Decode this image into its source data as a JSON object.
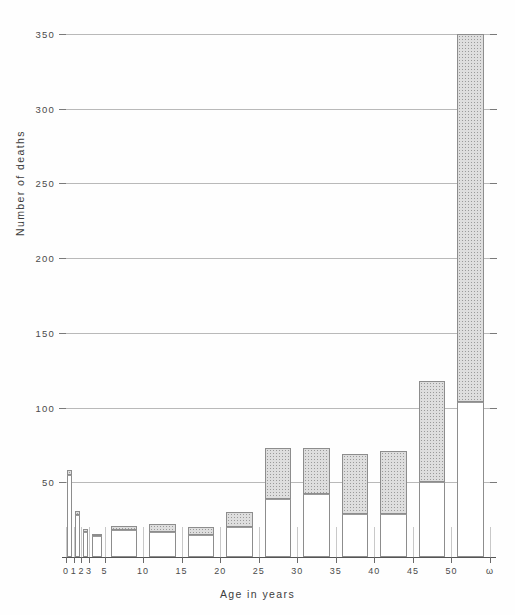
{
  "chart_data": {
    "type": "bar",
    "title": "",
    "xlabel": "Age in years",
    "ylabel": "Number of deaths",
    "ylim": [
      0,
      350
    ],
    "ytick_values": [
      50,
      100,
      150,
      200,
      250,
      300,
      350
    ],
    "ytick_labels": [
      "50",
      "100",
      "150",
      "200",
      "250",
      "300",
      "350"
    ],
    "xtick_labels": [
      "0",
      "1",
      "2",
      "3",
      "5",
      "10",
      "15",
      "20",
      "25",
      "30",
      "35",
      "40",
      "45",
      "50",
      "ω"
    ],
    "grid": "horizontal",
    "legend": "none",
    "stacked": true,
    "categories": [
      "0-1",
      "1-2",
      "2-3",
      "3-5",
      "5-10",
      "10-15",
      "15-20",
      "20-25",
      "25-30",
      "30-35",
      "35-40",
      "40-45",
      "45-50",
      "50-ω"
    ],
    "series": [
      {
        "name": "lower segment (unshaded)",
        "fill": "white",
        "values": [
          55,
          28,
          17,
          14,
          18,
          17,
          15,
          20,
          39,
          42,
          29,
          29,
          50,
          104
        ]
      },
      {
        "name": "upper segment (shaded)",
        "fill": "stippled",
        "values": [
          3,
          3,
          2,
          1,
          3,
          5,
          5,
          10,
          34,
          31,
          40,
          42,
          68,
          246
        ]
      }
    ],
    "totals": [
      58,
      31,
      19,
      15,
      21,
      22,
      20,
      30,
      73,
      73,
      69,
      71,
      118,
      350
    ],
    "bar_bounds": [
      {
        "label": "0-1",
        "x0": 0,
        "x1": 1
      },
      {
        "label": "1-2",
        "x0": 1,
        "x1": 2
      },
      {
        "label": "2-3",
        "x0": 2,
        "x1": 3
      },
      {
        "label": "3-5",
        "x0": 3,
        "x1": 5
      },
      {
        "label": "5-10",
        "x0": 5,
        "x1": 10
      },
      {
        "label": "10-15",
        "x0": 10,
        "x1": 15
      },
      {
        "label": "15-20",
        "x0": 15,
        "x1": 20
      },
      {
        "label": "20-25",
        "x0": 20,
        "x1": 25
      },
      {
        "label": "25-30",
        "x0": 25,
        "x1": 30
      },
      {
        "label": "30-35",
        "x0": 30,
        "x1": 35
      },
      {
        "label": "35-40",
        "x0": 35,
        "x1": 40
      },
      {
        "label": "40-45",
        "x0": 40,
        "x1": 45
      },
      {
        "label": "45-50",
        "x0": 45,
        "x1": 50
      },
      {
        "label": "50-ω",
        "x0": 50,
        "x1": 55
      }
    ],
    "colors": {
      "axis": "#555555",
      "gridline": "#b9b9b9",
      "bar_outline": "#8d8d8d",
      "segment_lower": "#ffffff",
      "segment_upper": "#dedede",
      "background": "#fefefe",
      "text": "#3c3c3c"
    }
  }
}
